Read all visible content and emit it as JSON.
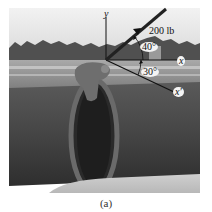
{
  "figure": {
    "caption": "(a)",
    "force_label": "200 lb",
    "angle_top": "40°",
    "angle_bottom": "30°",
    "axis_y": "y",
    "axis_x": "x",
    "axis_x_prime": "x′"
  },
  "colors": {
    "sky": "#e9e9e9",
    "trees": "#4a4a4a",
    "field": "#8a8a8a",
    "pipe": "#3f3f3f",
    "vector": "#111111"
  }
}
